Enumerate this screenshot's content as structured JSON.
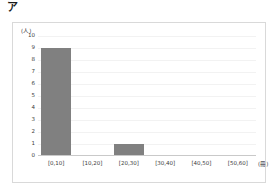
{
  "figure": {
    "label": "ア"
  },
  "chart_data": {
    "type": "bar",
    "title": "",
    "subtitle": "",
    "xlabel": "(冊)",
    "ylabel": "(人)",
    "categories": [
      "[0,10]",
      "[10,20]",
      "[20,30]",
      "[30,40]",
      "[40,50]",
      "[50,60]"
    ],
    "values": [
      9,
      0,
      1,
      0,
      0,
      0
    ],
    "ylim": [
      0,
      10
    ],
    "ytick_labels": [
      "10",
      "9",
      "8",
      "7",
      "6",
      "5",
      "4",
      "3",
      "2",
      "1",
      "0"
    ],
    "ytick_values": [
      10,
      9,
      8,
      7,
      6,
      5,
      4,
      3,
      2,
      1,
      0
    ],
    "grid": true,
    "legend": false,
    "bar_color": "#808080",
    "grid_color": "#f2f2f2",
    "axis_color": "#c9c9c9",
    "frame_color": "#d9d9d9",
    "background": "#ffffff",
    "text_color": "#3b3b3b"
  }
}
